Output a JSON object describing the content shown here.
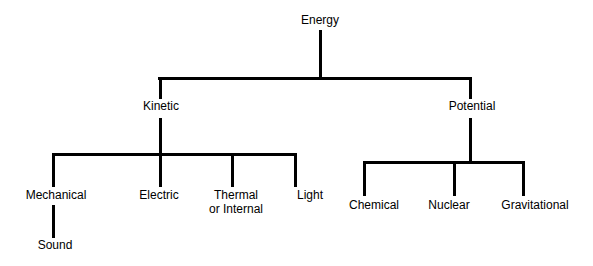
{
  "diagram": {
    "type": "hierarchy-tree",
    "background_color": "#ffffff",
    "line_color": "#000000",
    "text_color": "#000000",
    "line_width": 3,
    "nodes": [
      {
        "id": "energy",
        "label": "Energy",
        "level": 0,
        "x": 320,
        "y": 21
      },
      {
        "id": "kinetic",
        "label": "Kinetic",
        "level": 1,
        "x": 160,
        "y": 107
      },
      {
        "id": "potential",
        "label": "Potential",
        "level": 1,
        "x": 470,
        "y": 107
      },
      {
        "id": "mechanical",
        "label": "Mechanical",
        "level": 2,
        "x": 56,
        "y": 196
      },
      {
        "id": "electric",
        "label": "Electric",
        "level": 2,
        "x": 160,
        "y": 196
      },
      {
        "id": "thermal",
        "label": "Thermal",
        "level": 2,
        "x": 236,
        "y": 196
      },
      {
        "id": "thermal-line2",
        "label": "or Internal",
        "level": 2,
        "x": 236,
        "y": 210
      },
      {
        "id": "light",
        "label": "Light",
        "level": 2,
        "x": 310,
        "y": 196
      },
      {
        "id": "chemical",
        "label": "Chemical",
        "level": 2,
        "x": 374,
        "y": 206
      },
      {
        "id": "nuclear",
        "label": "Nuclear",
        "level": 2,
        "x": 449,
        "y": 206
      },
      {
        "id": "gravitational",
        "label": "Gravitational",
        "level": 2,
        "x": 535,
        "y": 206
      },
      {
        "id": "sound",
        "label": "Sound",
        "level": 3,
        "x": 55,
        "y": 246
      }
    ],
    "edges": [
      {
        "from": "energy",
        "to": "kinetic"
      },
      {
        "from": "energy",
        "to": "potential"
      },
      {
        "from": "kinetic",
        "to": "mechanical"
      },
      {
        "from": "kinetic",
        "to": "electric"
      },
      {
        "from": "kinetic",
        "to": "thermal"
      },
      {
        "from": "kinetic",
        "to": "light"
      },
      {
        "from": "potential",
        "to": "chemical"
      },
      {
        "from": "potential",
        "to": "nuclear"
      },
      {
        "from": "potential",
        "to": "gravitational"
      },
      {
        "from": "mechanical",
        "to": "sound"
      }
    ]
  }
}
